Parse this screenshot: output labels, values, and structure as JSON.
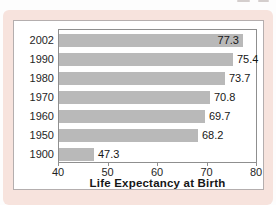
{
  "figure": {
    "card_color": "#f7e3dd",
    "panel_color": "#ffffff",
    "panel_border_color": "#b4aeae",
    "plot_border_color": "#8f8f8f",
    "bar_color": "#b9b9b9",
    "text_color": "#1f1f1f"
  },
  "chart_data": {
    "type": "bar",
    "orientation": "horizontal",
    "title": "",
    "xlabel": "Life Expectancy at Birth",
    "categories": [
      "2002",
      "1990",
      "1980",
      "1970",
      "1960",
      "1950",
      "1900"
    ],
    "values": [
      77.3,
      75.4,
      73.7,
      70.8,
      69.7,
      68.2,
      47.3
    ],
    "value_labels": [
      "77.3",
      "75.4",
      "73.7",
      "70.8",
      "69.7",
      "68.2",
      "47.3"
    ],
    "xlim": [
      40,
      80
    ],
    "xticks": [
      40,
      50,
      60,
      70,
      80
    ],
    "xtick_labels": [
      "40",
      "50",
      "60",
      "70",
      "80"
    ],
    "grid": false,
    "legend": null,
    "bar_color": "#b9b9b9"
  }
}
